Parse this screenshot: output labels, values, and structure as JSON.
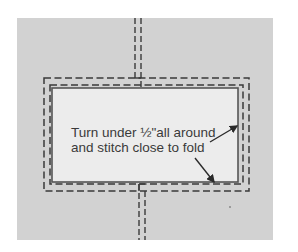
{
  "diagram": {
    "type": "sewing-instruction",
    "annotation": {
      "line1": "Turn under ½\"all around",
      "line2": "and stitch close to fold"
    },
    "colors": {
      "background_panel": "#d2d2d2",
      "fabric_patch": "#ececec",
      "stitch_lines": "#3a3a3a",
      "text": "#3a3a3a"
    }
  }
}
